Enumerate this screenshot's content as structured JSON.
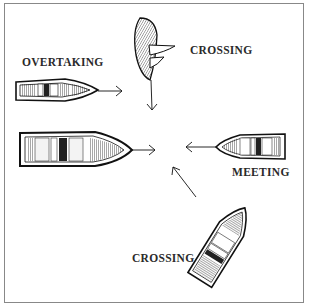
{
  "diagram": {
    "labels": {
      "overtaking": "OVERTAKING",
      "crossing_top": "CROSSING",
      "meeting": "MEETING",
      "crossing_bottom": "CROSSING"
    },
    "colors": {
      "ink": "#1a1a1a",
      "background": "#ffffff",
      "frame": "#888888"
    }
  }
}
